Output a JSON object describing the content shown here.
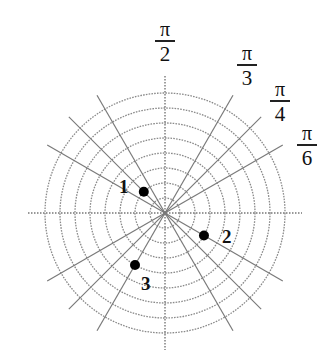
{
  "diagram": {
    "type": "polar-grid",
    "center": [
      165,
      213
    ],
    "ring_spacing_px": 15,
    "ring_count": 8,
    "radial_line_length_px": 136,
    "axis_extent_px": 137,
    "colors": {
      "ring": "#8a8a8a",
      "radial": "#7a7a7a",
      "axis": "#777777",
      "point": "#000000",
      "text": "#111111"
    },
    "angle_labels": [
      {
        "id": "pi-over-2",
        "numerator": "π",
        "denominator": "2",
        "x": 150,
        "y": 20
      },
      {
        "id": "pi-over-3",
        "numerator": "π",
        "denominator": "3",
        "x": 232,
        "y": 44
      },
      {
        "id": "pi-over-4",
        "numerator": "π",
        "denominator": "4",
        "x": 265,
        "y": 80
      },
      {
        "id": "pi-over-6",
        "numerator": "π",
        "denominator": "6",
        "x": 292,
        "y": 124
      }
    ],
    "points": [
      {
        "label": "1",
        "r": 2,
        "theta": "3π/4",
        "theta_deg": 135,
        "label_x": 119,
        "label_y": 177
      },
      {
        "label": "2",
        "r": 3,
        "theta": "11π/6",
        "theta_deg": 330,
        "label_x": 222,
        "label_y": 227
      },
      {
        "label": "3",
        "r": 4,
        "theta": "4π/3",
        "theta_deg": 240,
        "label_x": 141,
        "label_y": 274
      }
    ]
  }
}
